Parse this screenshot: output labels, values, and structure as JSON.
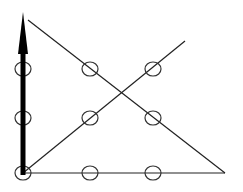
{
  "diagram": {
    "background": "#ffffff",
    "stroke_color": "#222222",
    "dots": [
      {
        "x": 23,
        "y": 69
      },
      {
        "x": 90,
        "y": 69
      },
      {
        "x": 153,
        "y": 69
      },
      {
        "x": 23,
        "y": 118
      },
      {
        "x": 90,
        "y": 118
      },
      {
        "x": 153,
        "y": 118
      },
      {
        "x": 23,
        "y": 173
      },
      {
        "x": 90,
        "y": 173
      },
      {
        "x": 153,
        "y": 173
      }
    ],
    "lines": [
      {
        "x1": 28,
        "y1": 20,
        "x2": 225,
        "y2": 173
      },
      {
        "x1": 23,
        "y1": 173,
        "x2": 225,
        "y2": 173
      },
      {
        "x1": 23,
        "y1": 173,
        "x2": 185,
        "y2": 41
      }
    ],
    "arrow": {
      "x": 23,
      "y_start": 175,
      "y_end": 12
    }
  }
}
